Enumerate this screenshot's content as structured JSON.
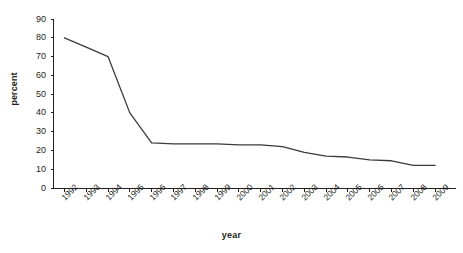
{
  "chart_data": {
    "type": "line",
    "title": "",
    "xlabel": "year",
    "ylabel": "percent",
    "x": [
      1992,
      1993,
      1994,
      1995,
      1996,
      1997,
      1998,
      1999,
      2000,
      2001,
      2002,
      2003,
      2004,
      2005,
      2006,
      2007,
      2008,
      2009
    ],
    "categories": [
      "1992",
      "1993",
      "1994",
      "1995",
      "1996",
      "1997",
      "1998",
      "1999",
      "2000",
      "2001",
      "2002",
      "2003",
      "2004",
      "2005",
      "2006",
      "2007",
      "2008",
      "2009"
    ],
    "values": [
      80,
      75,
      70,
      40,
      24,
      23.5,
      23.5,
      23.5,
      23,
      23,
      22,
      19,
      17,
      16.5,
      15,
      14.5,
      12,
      12
    ],
    "series": [
      {
        "name": "percent",
        "values": [
          80,
          75,
          70,
          40,
          24,
          23.5,
          23.5,
          23.5,
          23,
          23,
          22,
          19,
          17,
          16.5,
          15,
          14.5,
          12,
          12
        ]
      }
    ],
    "ylim": [
      0,
      90
    ],
    "ytick_values": [
      0,
      10,
      20,
      30,
      40,
      50,
      60,
      70,
      80,
      90
    ],
    "ytick_labels": [
      "0",
      "10",
      "20",
      "30",
      "40",
      "50",
      "60",
      "70",
      "80",
      "90"
    ],
    "xlim": [
      1992,
      2009
    ],
    "grid": false,
    "legend": false,
    "legend_position": "none",
    "line_color": "#3b3b3b",
    "axis_color": "#231f20",
    "background_color": "#ffffff",
    "markers": false
  }
}
